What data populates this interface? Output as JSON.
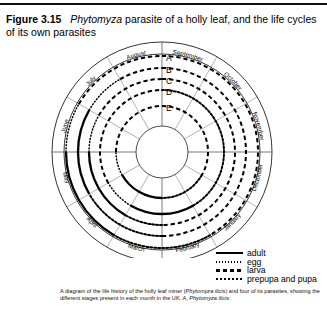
{
  "figure": {
    "number": "Figure 3.15",
    "title_part1": "Phytomyza",
    "title_part2": " parasite of a holly leaf, and the life cycles of its own parasites"
  },
  "diagram": {
    "months": [
      "September",
      "October",
      "November",
      "December",
      "January",
      "February",
      "March",
      "April",
      "May",
      "June",
      "July",
      "August"
    ],
    "ring_labels": [
      "A",
      "B",
      "C",
      "D",
      "E"
    ],
    "center": {
      "x": 162,
      "y": 119
    },
    "ring_radii": [
      96,
      84,
      73,
      62,
      46
    ],
    "outer_ring_radius": 110,
    "inner_hole_radius": 26
  },
  "legend": {
    "items": [
      {
        "label": "adult",
        "style": "solid"
      },
      {
        "label": "egg",
        "style": "dotted-fine"
      },
      {
        "label": "larva",
        "style": "dashed"
      },
      {
        "label": "prepupa and pupa",
        "style": "dotted"
      }
    ]
  },
  "caption": {
    "line1_a": "A diagram of the life history of the holly leaf miner (",
    "line1_i": "Phytomyza ilicis",
    "line1_b": ") and four of its parasites,",
    "line2_a": "showing the different stages present in each month in the UK. A, ",
    "line2_i": "Phytomyza ilicis",
    "line2_b": ":"
  },
  "chart_data": {
    "type": "radial-timeline",
    "angular_axis": "month",
    "categories": [
      "September",
      "October",
      "November",
      "December",
      "January",
      "February",
      "March",
      "April",
      "May",
      "June",
      "July",
      "August"
    ],
    "radial_axis": "species ring",
    "series": [
      {
        "name": "A",
        "ring": 0,
        "stages": [
          {
            "stage": "larva",
            "from": "September",
            "to": "February"
          },
          {
            "stage": "prepupa and pupa",
            "from": "February",
            "to": "April"
          },
          {
            "stage": "adult",
            "from": "April",
            "to": "June"
          },
          {
            "stage": "egg",
            "from": "June",
            "to": "July"
          },
          {
            "stage": "larva",
            "from": "July",
            "to": "September"
          }
        ]
      },
      {
        "name": "B",
        "ring": 1,
        "stages": [
          {
            "stage": "larva",
            "from": "September",
            "to": "March"
          },
          {
            "stage": "prepupa and pupa",
            "from": "March",
            "to": "May"
          },
          {
            "stage": "adult",
            "from": "May",
            "to": "July"
          },
          {
            "stage": "egg",
            "from": "July",
            "to": "August"
          },
          {
            "stage": "larva",
            "from": "August",
            "to": "September"
          }
        ]
      },
      {
        "name": "C",
        "ring": 2,
        "stages": [
          {
            "stage": "larva",
            "from": "September",
            "to": "March"
          },
          {
            "stage": "prepupa and pupa",
            "from": "March",
            "to": "April"
          },
          {
            "stage": "adult",
            "from": "April",
            "to": "June"
          },
          {
            "stage": "egg",
            "from": "June",
            "to": "July"
          },
          {
            "stage": "larva",
            "from": "July",
            "to": "September"
          }
        ]
      },
      {
        "name": "D",
        "ring": 3,
        "stages": [
          {
            "stage": "prepupa and pupa",
            "from": "September",
            "to": "February"
          },
          {
            "stage": "adult",
            "from": "February",
            "to": "April"
          },
          {
            "stage": "egg",
            "from": "April",
            "to": "May"
          },
          {
            "stage": "larva",
            "from": "May",
            "to": "September"
          }
        ]
      },
      {
        "name": "E",
        "ring": 4,
        "stages": [
          {
            "stage": "larva",
            "from": "September",
            "to": "January"
          },
          {
            "stage": "prepupa and pupa",
            "from": "January",
            "to": "March"
          },
          {
            "stage": "adult",
            "from": "March",
            "to": "May"
          },
          {
            "stage": "egg",
            "from": "May",
            "to": "June"
          },
          {
            "stage": "larva",
            "from": "June",
            "to": "September"
          }
        ]
      }
    ]
  }
}
